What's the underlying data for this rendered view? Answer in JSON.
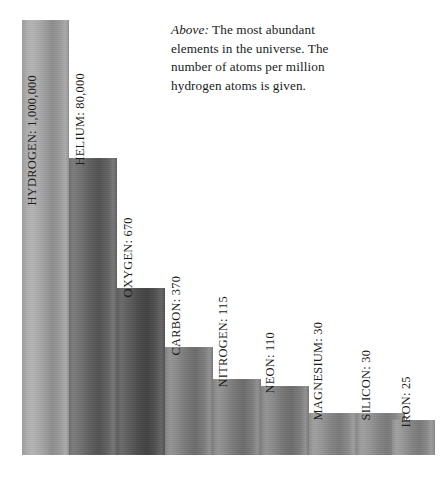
{
  "caption": {
    "lead": "Above:",
    "text": " The most abundant elements in the universe. The number of atoms per million hydrogen atoms is given."
  },
  "chart_data": {
    "type": "bar",
    "title": "",
    "subtitle": "",
    "xlabel": "",
    "ylabel": "",
    "scale": "logarithmic",
    "unit": "atoms per million hydrogen atoms",
    "grid": false,
    "legend": false,
    "axis_visible": false,
    "categories": [
      "HYDROGEN",
      "HELIUM",
      "OXYGEN",
      "CARBON",
      "NITROGEN",
      "NEON",
      "MAGNESIUM",
      "SILICON",
      "IRON"
    ],
    "values": [
      1000000,
      80000,
      670,
      370,
      115,
      110,
      30,
      30,
      25
    ],
    "value_labels": [
      "1,000,000",
      "80,000",
      "670",
      "370",
      "115",
      "110",
      "30",
      "30",
      "25"
    ],
    "bar_labels": [
      "HYDROGEN: 1,000,000",
      "HELIUM: 80,000",
      "OXYGEN: 670",
      "CARBON: 370",
      "NITROGEN: 115",
      "NEON: 110",
      "MAGNESIUM: 30",
      "SILICON: 30",
      "IRON: 25"
    ]
  },
  "bars": [
    {
      "label": "HYDROGEN: 1,000,000",
      "value": 1000000,
      "left": 22,
      "width": 47,
      "top": 20,
      "tone": "tone-light",
      "label_left": 38,
      "label_bottom": 286,
      "label_placement": "inside"
    },
    {
      "label": "HELIUM: 80,000",
      "value": 80000,
      "left": 69,
      "width": 48,
      "top": 158,
      "tone": "tone-dark",
      "label_left": 86,
      "label_bottom": 326,
      "label_placement": "above"
    },
    {
      "label": "OXYGEN: 670",
      "value": 670,
      "left": 117,
      "width": 48,
      "top": 288,
      "tone": "tone-darkest",
      "label_left": 134,
      "label_bottom": 194,
      "label_placement": "above"
    },
    {
      "label": "CARBON: 370",
      "value": 370,
      "left": 165,
      "width": 48,
      "top": 347,
      "tone": "tone-mid",
      "label_left": 182,
      "label_bottom": 136,
      "label_placement": "above"
    },
    {
      "label": "NITROGEN: 115",
      "value": 115,
      "left": 213,
      "width": 48,
      "top": 379,
      "tone": "tone-mid",
      "label_left": 229,
      "label_bottom": 104,
      "label_placement": "above"
    },
    {
      "label": "NEON: 110",
      "value": 110,
      "left": 261,
      "width": 48,
      "top": 386,
      "tone": "tone-mid",
      "label_left": 276,
      "label_bottom": 98,
      "label_placement": "above"
    },
    {
      "label": "MAGNESIUM: 30",
      "value": 30,
      "left": 309,
      "width": 48,
      "top": 413,
      "tone": "tone-midlight",
      "label_left": 324,
      "label_bottom": 71,
      "label_placement": "above"
    },
    {
      "label": "SILICON: 30",
      "value": 30,
      "left": 357,
      "width": 48,
      "top": 413,
      "tone": "tone-midlight",
      "label_left": 372,
      "label_bottom": 71,
      "label_placement": "above"
    },
    {
      "label": "IRON: 25",
      "value": 25,
      "left": 392,
      "width": 43,
      "top": 420,
      "tone": "tone-midlight",
      "label_left": 412,
      "label_bottom": 64,
      "label_placement": "above"
    }
  ]
}
